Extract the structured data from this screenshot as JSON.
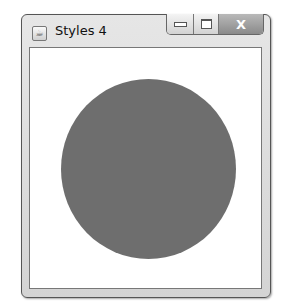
{
  "window": {
    "title": "Styles 4",
    "app_icon": "java-cup-icon",
    "controls": {
      "minimize": "minimize-icon",
      "maximize": "maximize-icon",
      "close_label": "X"
    }
  },
  "canvas": {
    "shape": "circle",
    "fill_color": "#6e6e6e",
    "background_color": "#ffffff"
  }
}
